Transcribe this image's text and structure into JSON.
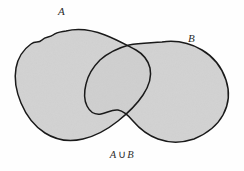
{
  "figure": {
    "type": "venn-diagram",
    "title": "",
    "caption": {
      "left_operand": "A",
      "operator": "∪",
      "right_operand": "B",
      "full": "A ∪ B"
    },
    "labels": {
      "set_a": "A",
      "set_b": "B"
    },
    "colors": {
      "background": "#fefefe",
      "fill": "#d2d2d2",
      "outline": "#1a1a1a",
      "text": "#2b2b2b"
    },
    "regions": [
      {
        "name": "set-a-blob",
        "label": "A",
        "shaded": true,
        "description": "left irregular closed blob"
      },
      {
        "name": "set-b-blob",
        "label": "B",
        "shaded": true,
        "description": "right irregular closed blob"
      },
      {
        "name": "intersection-region",
        "label": "A ∩ B",
        "shaded": true,
        "description": "lens-shaped overlap of the two blobs, shaded the same as the rest"
      }
    ],
    "shading_note": "entire union shaded"
  }
}
